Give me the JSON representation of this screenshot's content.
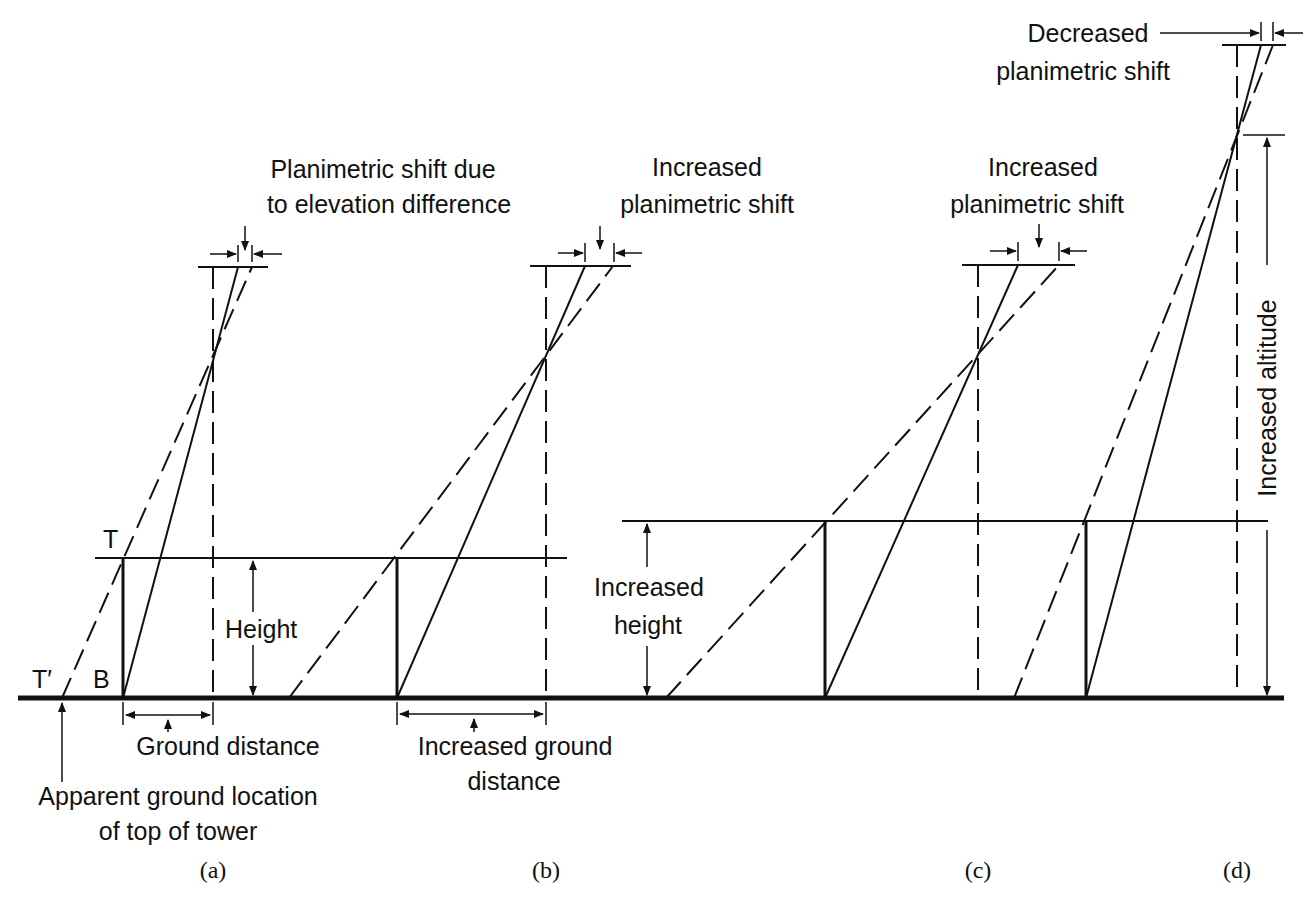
{
  "figure": {
    "panels": [
      {
        "id": "a",
        "caption": "(a)"
      },
      {
        "id": "b",
        "caption": "(b)"
      },
      {
        "id": "c",
        "caption": "(c)"
      },
      {
        "id": "d",
        "caption": "(d)"
      }
    ],
    "labels": {
      "shift_a_line1": "Planimetric shift due",
      "shift_a_line2": "to elevation difference",
      "shift_b_line1": "Increased",
      "shift_b_line2": "planimetric shift",
      "shift_c_line1": "Increased",
      "shift_c_line2": "planimetric shift",
      "shift_d_line1": "Decreased",
      "shift_d_line2": "planimetric shift",
      "point_T": "T",
      "point_T_prime": "T′",
      "point_B": "B",
      "height": "Height",
      "ground_distance": "Ground distance",
      "apparent_line1": "Apparent ground location",
      "apparent_line2": "of top of tower",
      "increased_ground_line1": "Increased ground",
      "increased_ground_line2": "distance",
      "increased_height_line1": "Increased",
      "increased_height_line2": "height",
      "increased_altitude": "Increased altitude"
    }
  }
}
